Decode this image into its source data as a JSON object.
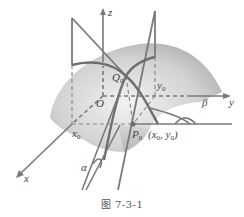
{
  "figure": {
    "caption": "图 7-3-1",
    "colors": {
      "line": "#7a7a7a",
      "curve": "#6e6e6e",
      "surface_light": "#e8e8e8",
      "surface_dark": "#9a9a9a",
      "text": "#444444"
    },
    "labels": {
      "z_axis": "z",
      "y_axis": "y",
      "x_axis": "x",
      "origin": "O",
      "x0": "x",
      "x0_sub": "0",
      "y0": "y",
      "y0_sub": "0",
      "q0": "Q",
      "q0_sub": "0",
      "p0": "P",
      "p0_sub": "0",
      "p0_coords_open": "(x",
      "p0_coords_mid": ", y",
      "p0_coords_close": ")",
      "alpha": "α",
      "beta": "β"
    }
  }
}
